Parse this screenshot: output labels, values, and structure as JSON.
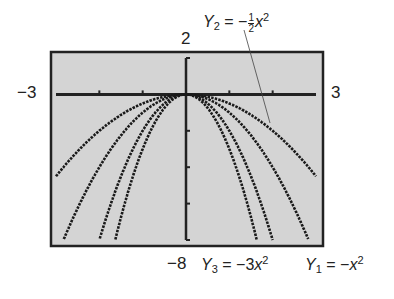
{
  "chart_data": {
    "type": "line",
    "title": "",
    "xlabel": "",
    "ylabel": "",
    "xlim": [
      -3,
      3
    ],
    "ylim": [
      -8,
      2
    ],
    "x_ticks": [
      -2,
      -1,
      1,
      2
    ],
    "y_ticks": [
      -2,
      -4,
      -6,
      -8
    ],
    "grid": false,
    "window_labels": {
      "xmin": "−3",
      "xmax": "3",
      "ymax": "2",
      "ymin": "−8"
    },
    "series": [
      {
        "name": "Y1 = −x²",
        "coef": -1,
        "x": [
          -3,
          -2,
          -1,
          0,
          1,
          2,
          3
        ],
        "y": [
          -9,
          -4,
          -1,
          0,
          -1,
          -4,
          -9
        ]
      },
      {
        "name": "Y2 = −½x²",
        "coef": -0.5,
        "x": [
          -3,
          -2,
          -1,
          0,
          1,
          2,
          3
        ],
        "y": [
          -4.5,
          -2,
          -0.5,
          0,
          -0.5,
          -2,
          -4.5
        ]
      },
      {
        "name": "Y3 = −3x²",
        "coef": -3,
        "x": [
          -2,
          -1,
          0,
          1,
          2
        ],
        "y": [
          -12,
          -3,
          0,
          -3,
          -12
        ]
      },
      {
        "name": "−2x²",
        "coef": -2,
        "x": [
          -2,
          -1,
          0,
          1,
          2
        ],
        "y": [
          -8,
          -2,
          0,
          -2,
          -8
        ]
      }
    ],
    "background": "#d4d4d4"
  },
  "labels": {
    "xmin": "−3",
    "xmax": "3",
    "ymax": "2",
    "ymin": "−8",
    "y2_name": "Y",
    "y2_sub": "2",
    "y2_eq": "= −",
    "y2_num": "1",
    "y2_den": "2",
    "y2_var": "x",
    "y3_name": "Y",
    "y3_sub": "3",
    "y3_eq": "= −3",
    "y3_var": "x",
    "y1_name": "Y",
    "y1_sub": "1",
    "y1_eq": "= −",
    "y1_var": "x",
    "sq": "2"
  }
}
